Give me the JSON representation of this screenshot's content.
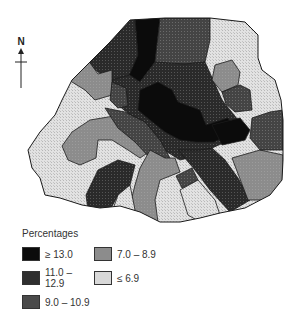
{
  "compass": {
    "label": "N"
  },
  "legend": {
    "title": "Percentages",
    "items": [
      {
        "label": "≥ 13.0",
        "color": "#0a0a0a",
        "class": "c1"
      },
      {
        "label": "7.0 – 8.9",
        "color": "#8a8a8a",
        "class": "c4"
      },
      {
        "label": "11.0 – 12.9",
        "color": "#2e2e2e",
        "class": "c2"
      },
      {
        "label": "≤ 6.9",
        "color": "#d6d6d6",
        "class": "c5"
      },
      {
        "label": "9.0 – 10.9",
        "color": "#474747",
        "class": "c3"
      }
    ]
  },
  "colors": {
    "c1": "#0b0b0b",
    "c2": "#2f2f2f",
    "c3": "#4a4a4a",
    "c4": "#8c8c8c",
    "c5": "#d8d8d8",
    "outline": "#1a1a1a"
  }
}
